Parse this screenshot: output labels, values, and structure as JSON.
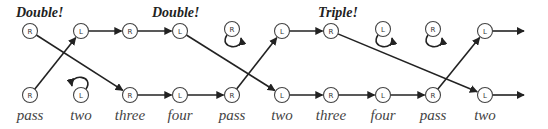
{
  "diagram": {
    "type": "dance-step-sequence",
    "callouts": [
      {
        "text": "Double!",
        "x": 16,
        "y": 17
      },
      {
        "text": "Double!",
        "x": 152,
        "y": 17
      },
      {
        "text": "Triple!",
        "x": 318,
        "y": 17
      }
    ],
    "top_nodes": [
      {
        "foot": "R",
        "x": 30,
        "y": 31,
        "loop": false
      },
      {
        "foot": "L",
        "x": 81,
        "y": 31,
        "loop": false
      },
      {
        "foot": "R",
        "x": 130,
        "y": 31,
        "loop": false
      },
      {
        "foot": "L",
        "x": 180,
        "y": 31,
        "loop": false
      },
      {
        "foot": "R",
        "x": 232,
        "y": 29,
        "loop": true
      },
      {
        "foot": "L",
        "x": 282,
        "y": 31,
        "loop": false
      },
      {
        "foot": "R",
        "x": 331,
        "y": 31,
        "loop": false
      },
      {
        "foot": "L",
        "x": 383,
        "y": 29,
        "loop": true
      },
      {
        "foot": "R",
        "x": 433,
        "y": 29,
        "loop": true
      },
      {
        "foot": "L",
        "x": 485,
        "y": 31,
        "loop": false
      }
    ],
    "bottom_nodes": [
      {
        "foot": "R",
        "x": 30,
        "y": 95,
        "label": "pass",
        "loop": false
      },
      {
        "foot": "L",
        "x": 81,
        "y": 95,
        "label": "two",
        "loop": true
      },
      {
        "foot": "R",
        "x": 130,
        "y": 95,
        "label": "three",
        "loop": false
      },
      {
        "foot": "L",
        "x": 180,
        "y": 95,
        "label": "four",
        "loop": false
      },
      {
        "foot": "R",
        "x": 232,
        "y": 95,
        "label": "pass",
        "loop": false
      },
      {
        "foot": "L",
        "x": 282,
        "y": 95,
        "label": "two",
        "loop": false
      },
      {
        "foot": "R",
        "x": 331,
        "y": 95,
        "label": "three",
        "loop": false
      },
      {
        "foot": "L",
        "x": 383,
        "y": 95,
        "label": "four",
        "loop": false
      },
      {
        "foot": "R",
        "x": 433,
        "y": 95,
        "label": "pass",
        "loop": false
      },
      {
        "foot": "L",
        "x": 485,
        "y": 95,
        "label": "two",
        "loop": false
      }
    ],
    "edges": [
      {
        "from": [
          30,
          95
        ],
        "to": [
          81,
          31
        ]
      },
      {
        "from": [
          30,
          31
        ],
        "to": [
          130,
          95
        ]
      },
      {
        "from": [
          81,
          31
        ],
        "to": [
          130,
          31
        ]
      },
      {
        "from": [
          130,
          31
        ],
        "to": [
          180,
          31
        ]
      },
      {
        "from": [
          130,
          95
        ],
        "to": [
          180,
          95
        ]
      },
      {
        "from": [
          180,
          95
        ],
        "to": [
          232,
          95
        ]
      },
      {
        "from": [
          180,
          31
        ],
        "to": [
          282,
          95
        ]
      },
      {
        "from": [
          232,
          95
        ],
        "to": [
          282,
          31
        ]
      },
      {
        "from": [
          282,
          31
        ],
        "to": [
          331,
          31
        ]
      },
      {
        "from": [
          282,
          95
        ],
        "to": [
          331,
          95
        ]
      },
      {
        "from": [
          331,
          95
        ],
        "to": [
          383,
          95
        ]
      },
      {
        "from": [
          383,
          95
        ],
        "to": [
          433,
          95
        ]
      },
      {
        "from": [
          331,
          31
        ],
        "to": [
          485,
          95
        ]
      },
      {
        "from": [
          433,
          95
        ],
        "to": [
          485,
          31
        ]
      },
      {
        "from": [
          485,
          31
        ],
        "to": [
          524,
          31
        ]
      },
      {
        "from": [
          485,
          95
        ],
        "to": [
          524,
          95
        ]
      }
    ]
  }
}
